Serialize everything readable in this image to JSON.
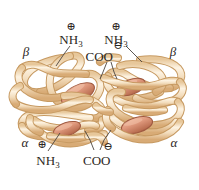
{
  "figure": {
    "background_color": "#ffffff",
    "ribbon_fill": "#f5e3c8",
    "ribbon_edge": "#c79a62",
    "ribbon_highlight": "#fdf4e4",
    "heme_fill": "#e09a7e",
    "heme_edge": "#a85f45",
    "label_color": "#2b2622",
    "leader_color": "#4a4440"
  },
  "subunit_labels": [
    {
      "name": "beta-top-left",
      "text": "β",
      "x": 26,
      "y": 52
    },
    {
      "name": "beta-top-right",
      "text": "β",
      "x": 172,
      "y": 52
    },
    {
      "name": "alpha-bottom-left",
      "text": "α",
      "x": 25,
      "y": 143
    },
    {
      "name": "alpha-bottom-right",
      "text": "α",
      "x": 173,
      "y": 143
    }
  ],
  "terminus_labels": [
    {
      "name": "amino-terminus-top-left",
      "charge": "⊕",
      "text": "NH",
      "subscript": "3",
      "charge_x": 71,
      "charge_y": 26,
      "text_x": 60,
      "text_y": 40
    },
    {
      "name": "amino-terminus-top-right",
      "charge": "⊕",
      "text": "NH",
      "subscript": "3",
      "charge_x": 116,
      "charge_y": 26,
      "text_x": 105,
      "text_y": 40
    },
    {
      "name": "carboxyl-terminus-top",
      "charge": "⊖",
      "text": "COO",
      "subscript": "",
      "charge_x": 117,
      "charge_y": 45,
      "text_x": 96,
      "text_y": 57
    },
    {
      "name": "amino-terminus-bottom-left",
      "charge": "⊕",
      "text": "NH",
      "subscript": "3",
      "charge_x": 42,
      "charge_y": 144,
      "text_x": 39,
      "text_y": 162
    },
    {
      "name": "carboxyl-terminus-bottom",
      "charge": "⊖",
      "text": "COO",
      "subscript": "",
      "charge_x": 106,
      "charge_y": 145,
      "text_x": 83,
      "text_y": 161
    }
  ],
  "heme_groups": [
    {
      "name": "heme-beta-left",
      "cx": 78,
      "cy": 94,
      "rx": 17,
      "ry": 8,
      "rot": -28
    },
    {
      "name": "heme-beta-right",
      "cx": 131,
      "cy": 87,
      "rx": 14,
      "ry": 7,
      "rot": -20
    },
    {
      "name": "heme-alpha-left",
      "cx": 66,
      "cy": 129,
      "rx": 13,
      "ry": 6,
      "rot": -18
    },
    {
      "name": "heme-alpha-right",
      "cx": 136,
      "cy": 125,
      "rx": 15,
      "ry": 7,
      "rot": -16
    }
  ],
  "leader_lines": [
    {
      "name": "leader-nh3-top-left",
      "points": "70,46 64,54 58,66"
    },
    {
      "name": "leader-nh3-top-right",
      "points": "126,46 133,55 141,62"
    },
    {
      "name": "leader-coo-top-a",
      "points": "107,62 103,72 100,78"
    },
    {
      "name": "leader-coo-top-b",
      "points": "111,62 114,72 116,79"
    },
    {
      "name": "leader-nh3-bottom",
      "points": "48,152 54,142 60,133"
    },
    {
      "name": "leader-coo-bottom-a",
      "points": "94,150 90,140 85,132"
    },
    {
      "name": "leader-coo-bottom-b",
      "points": "100,150 104,140 110,130"
    }
  ]
}
